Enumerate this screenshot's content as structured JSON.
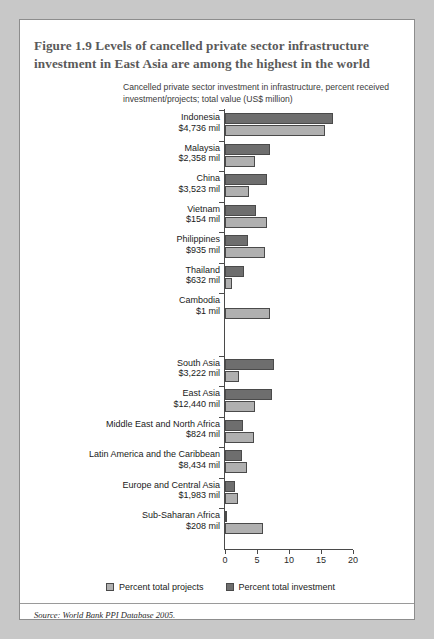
{
  "figure": {
    "title": "Figure 1.9  Levels of cancelled private sector infrastructure investment in East Asia are among the highest in the world",
    "subtitle": "Cancelled private sector investment in infrastructure, percent received investment/projects; total value (US$ million)",
    "source": "Source: World Bank PPI Database 2005."
  },
  "legend": {
    "items": [
      {
        "label": "Percent total projects",
        "color": "#b0b0b0",
        "swatch": "light-gray-square-icon"
      },
      {
        "label": "Percent total investment",
        "color": "#6e6e6e",
        "swatch": "dark-gray-square-icon"
      }
    ]
  },
  "colors": {
    "bar_investment": "#6e6e6e",
    "bar_projects": "#b0b0b0",
    "axis": "#4a4a4a",
    "title_text": "#5a5a5a",
    "page_background": "#c8c8c8",
    "card_background": "#ffffff",
    "card_border": "#8d8d8d"
  },
  "chart_data": {
    "type": "bar",
    "orientation": "horizontal",
    "title": "Cancelled private sector investment in infrastructure, percent received investment/projects; total value (US$ million)",
    "xlabel": "",
    "ylabel": "",
    "xlim": [
      0,
      20
    ],
    "xticks": [
      0,
      5,
      10,
      15,
      20
    ],
    "grid": false,
    "legend_position": "bottom",
    "categories": [
      "Indonesia",
      "Malaysia",
      "China",
      "Vietnam",
      "Philippines",
      "Thailand",
      "Cambodia",
      "South Asia",
      "East Asia",
      "Middle East and North Africa",
      "Latin America and the Caribbean",
      "Europe and Central Asia",
      "Sub-Saharan Africa"
    ],
    "category_values": [
      "$4,736 mil",
      "$2,358 mil",
      "$3,523 mil",
      "$154 mil",
      "$935 mil",
      "$632 mil",
      "$1 mil",
      "$3,222 mil",
      "$12,440 mil",
      "$824 mil",
      "$8,434 mil",
      "$1,983 mil",
      "$208 mil"
    ],
    "series": [
      {
        "name": "Percent total investment",
        "color": "#6e6e6e",
        "values": [
          16.9,
          7.1,
          6.5,
          4.9,
          3.6,
          2.9,
          0.0,
          7.6,
          7.3,
          2.8,
          2.6,
          1.5,
          0.2
        ]
      },
      {
        "name": "Percent total projects",
        "color": "#b0b0b0",
        "values": [
          15.6,
          4.7,
          3.7,
          6.6,
          6.3,
          1.1,
          7.0,
          2.2,
          4.7,
          4.6,
          3.4,
          2.1,
          6.0
        ]
      }
    ],
    "group_break_after": "Cambodia"
  }
}
